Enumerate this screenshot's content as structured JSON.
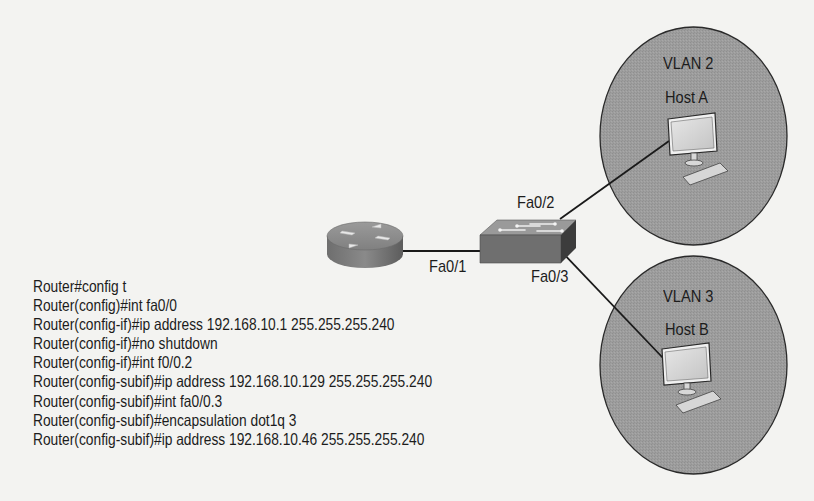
{
  "diagram": {
    "router": {
      "icon": "router-icon",
      "interface": "Fa0/1"
    },
    "switch": {
      "icon": "switch-icon",
      "ports": [
        {
          "label": "Fa0/1",
          "connects_to": "router"
        },
        {
          "label": "Fa0/2",
          "connects_to": "Host A"
        },
        {
          "label": "Fa0/3",
          "connects_to": "Host B"
        }
      ]
    },
    "vlans": [
      {
        "label": "VLAN 2",
        "host": "Host A",
        "icon": "computer-icon"
      },
      {
        "label": "VLAN 3",
        "host": "Host B",
        "icon": "computer-icon"
      }
    ],
    "colors": {
      "background": "#f3f3f1",
      "vlan_fill": "#9b9b9b",
      "line": "#1a1a1a",
      "text": "#1c1c1c"
    }
  },
  "config_lines": [
    "Router#config t",
    "Router(config)#int fa0/0",
    "Router(config-if)#ip address 192.168.10.1 255.255.255.240",
    "Router(config-if)#no shutdown",
    "Router(config-if)#int f0/0.2",
    "Router(config-subif)#ip address 192.168.10.129 255.255.255.240",
    "Router(config-subif)#int fa0/0.3",
    "Router(config-subif)#encapsulation dot1q 3",
    "Router(config-subif)#ip address 192.168.10.46 255.255.255.240"
  ]
}
